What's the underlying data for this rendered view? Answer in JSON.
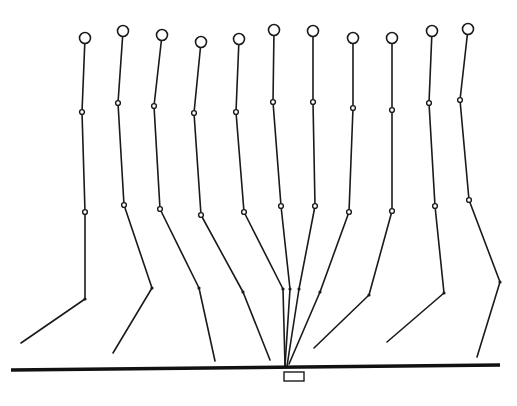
{
  "diagram": {
    "type": "gait-stick-figure-sequence",
    "colors": {
      "line": "#1a1a1a",
      "background": "#ffffff"
    },
    "ground": {
      "x1": 11,
      "y1": 370,
      "x2": 500,
      "y2": 365
    },
    "force_plate": {
      "x": 284,
      "y": 372,
      "width": 20,
      "height": 9
    },
    "figures": [
      {
        "head": [
          85,
          38
        ],
        "hip": [
          82,
          112
        ],
        "knee": [
          85,
          212
        ],
        "ankle": [
          85,
          299
        ],
        "toe": [
          21,
          343
        ]
      },
      {
        "head": [
          123,
          31
        ],
        "hip": [
          118,
          103
        ],
        "knee": [
          124,
          205
        ],
        "ankle": [
          152,
          288
        ],
        "toe": [
          113,
          353
        ]
      },
      {
        "head": [
          162,
          35
        ],
        "hip": [
          154,
          106
        ],
        "knee": [
          160,
          209
        ],
        "ankle": [
          199,
          288
        ],
        "toe": [
          215,
          361
        ]
      },
      {
        "head": [
          201,
          42
        ],
        "hip": [
          194,
          113
        ],
        "knee": [
          201,
          215
        ],
        "ankle": [
          243,
          292
        ],
        "toe": [
          270,
          360
        ]
      },
      {
        "head": [
          239,
          39
        ],
        "hip": [
          236,
          112
        ],
        "knee": [
          244,
          212
        ],
        "ankle": [
          283,
          289
        ],
        "toe": [
          285,
          366
        ]
      },
      {
        "head": [
          274,
          30
        ],
        "hip": [
          273,
          102
        ],
        "knee": [
          281,
          206
        ],
        "ankle": [
          290,
          289
        ],
        "toe": [
          285,
          366
        ]
      },
      {
        "head": [
          313,
          31
        ],
        "hip": [
          313,
          102
        ],
        "knee": [
          315,
          206
        ],
        "ankle": [
          299,
          289
        ],
        "toe": [
          287,
          366
        ]
      },
      {
        "head": [
          353,
          38
        ],
        "hip": [
          353,
          108
        ],
        "knee": [
          349,
          212
        ],
        "ankle": [
          320,
          292
        ],
        "toe": [
          289,
          364
        ]
      },
      {
        "head": [
          392,
          38
        ],
        "hip": [
          392,
          110
        ],
        "knee": [
          392,
          211
        ],
        "ankle": [
          369,
          295
        ],
        "toe": [
          314,
          348
        ]
      },
      {
        "head": [
          432,
          31
        ],
        "hip": [
          429,
          103
        ],
        "knee": [
          435,
          206
        ],
        "ankle": [
          444,
          293
        ],
        "toe": [
          387,
          342
        ]
      },
      {
        "head": [
          468,
          29
        ],
        "hip": [
          460,
          100
        ],
        "knee": [
          469,
          200
        ],
        "ankle": [
          500,
          282
        ],
        "toe": [
          477,
          357
        ]
      }
    ],
    "sizes": {
      "head_radius": 5.5,
      "open_joint_radius": 2.4,
      "dot_joint_radius": 1.6
    }
  }
}
